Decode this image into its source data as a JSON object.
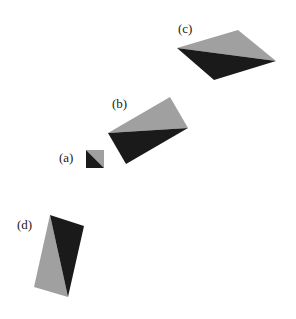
{
  "figure": {
    "colors": {
      "light": "#a0a0a0",
      "dark": "#1a1a1a"
    },
    "shapes": [
      {
        "label": "(a)",
        "light": "86,150 104,150 104,168",
        "dark": "86,150 104,168 86,168",
        "label_pos": [
          59,
          150
        ]
      },
      {
        "label": "(b)",
        "light": "108,133 170,97 188,128",
        "dark": "108,133 188,128 126,164",
        "label_pos": [
          112,
          96
        ]
      },
      {
        "label": "(c)",
        "light": "177,48 238,30 276,61",
        "dark": "177,48 276,61 214,80",
        "label_pos": [
          178,
          21
        ]
      },
      {
        "label": "(d)",
        "light": "50,215 68,297 34,287",
        "dark": "50,215 84,226 68,297",
        "label_pos": [
          17,
          217
        ]
      }
    ]
  }
}
